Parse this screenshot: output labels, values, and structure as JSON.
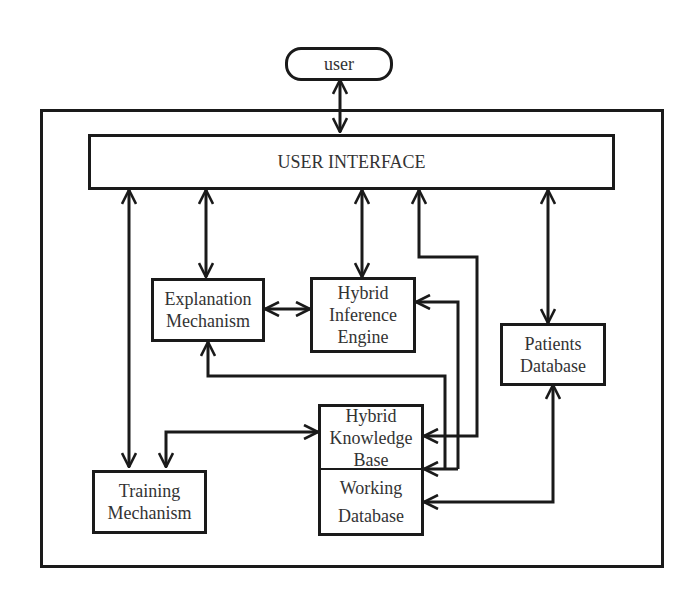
{
  "diagram": {
    "nodes": {
      "user": {
        "lines": [
          "user"
        ]
      },
      "ui": {
        "lines": [
          "USER INTERFACE"
        ]
      },
      "explanation": {
        "lines": [
          "Explanation",
          "Mechanism"
        ]
      },
      "inference": {
        "lines": [
          "Hybrid",
          "Inference",
          "Engine"
        ]
      },
      "patients": {
        "lines": [
          "Patients",
          "Database"
        ]
      },
      "knowledge": {
        "lines": [
          "Hybrid",
          "Knowledge",
          "Base"
        ]
      },
      "working": {
        "lines": [
          "Working",
          "Database"
        ]
      },
      "training": {
        "lines": [
          "Training",
          "Mechanism"
        ]
      }
    },
    "edges": [
      {
        "from": "user",
        "to": "ui",
        "type": "bidirectional"
      },
      {
        "from": "ui",
        "to": "training",
        "type": "bidirectional"
      },
      {
        "from": "ui",
        "to": "explanation",
        "type": "bidirectional"
      },
      {
        "from": "ui",
        "to": "inference",
        "type": "bidirectional"
      },
      {
        "from": "knowledge",
        "to": "ui",
        "type": "bidirectional"
      },
      {
        "from": "ui",
        "to": "patients",
        "type": "bidirectional"
      },
      {
        "from": "explanation",
        "to": "inference",
        "type": "bidirectional"
      },
      {
        "from": "working",
        "to": "inference",
        "type": "bidirectional"
      },
      {
        "from": "working",
        "to": "explanation",
        "type": "bidirectional"
      },
      {
        "from": "training",
        "to": "knowledge",
        "type": "bidirectional"
      },
      {
        "from": "patients",
        "to": "working",
        "type": "bidirectional"
      }
    ],
    "colors": {
      "stroke": "#1a1a1a",
      "text": "#333333",
      "background": "#ffffff"
    }
  }
}
